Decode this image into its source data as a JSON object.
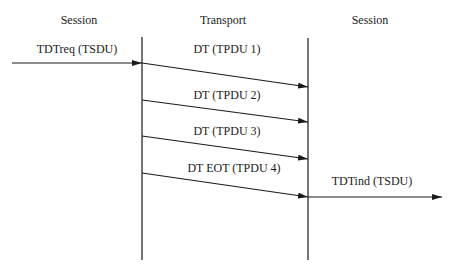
{
  "headers": {
    "left": "Session",
    "middle": "Transport",
    "right": "Session"
  },
  "request": {
    "label": "TDTreq (TSDU)"
  },
  "tpdus": [
    {
      "label": "DT (TPDU 1)"
    },
    {
      "label": "DT (TPDU 2)"
    },
    {
      "label": "DT (TPDU 3)"
    },
    {
      "label": "DT EOT (TPDU 4)"
    }
  ],
  "indication": {
    "label": "TDTind (TSDU)"
  },
  "colors": {
    "line": "#1a1a1a",
    "background": "#ffffff"
  }
}
